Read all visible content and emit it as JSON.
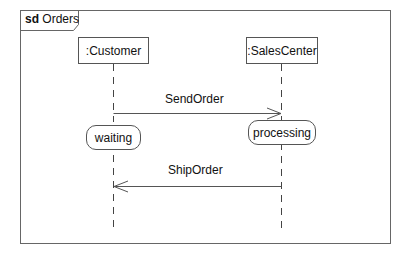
{
  "frame": {
    "keyword": "sd",
    "name": "Orders",
    "border_color": "#666666"
  },
  "lifelines": [
    {
      "id": "customer",
      "label": ":Customer"
    },
    {
      "id": "salescenter",
      "label": ":SalesCenter"
    }
  ],
  "messages": [
    {
      "label": "SendOrder",
      "from": ":Customer",
      "to": ":SalesCenter",
      "arrow": "open"
    },
    {
      "label": "ShipOrder",
      "from": ":SalesCenter",
      "to": ":Customer",
      "arrow": "open"
    }
  ],
  "states": [
    {
      "label": "waiting",
      "lifeline": ":Customer"
    },
    {
      "label": "processing",
      "lifeline": ":SalesCenter"
    }
  ]
}
